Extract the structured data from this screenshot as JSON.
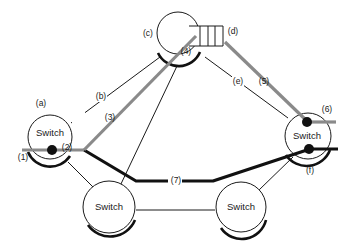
{
  "diagram": {
    "type": "network-path-diagram",
    "nodes": [
      {
        "id": "left-switch",
        "label": "Switch",
        "annotation": "(a)"
      },
      {
        "id": "top-node",
        "label": "",
        "annotation": "(c)",
        "port_annotation": "(4)"
      },
      {
        "id": "right-switch",
        "label": "Switch",
        "annotations": [
          "(6)",
          "(f)"
        ]
      },
      {
        "id": "bottom-left-switch",
        "label": "Switch"
      },
      {
        "id": "bottom-right-switch",
        "label": "Switch"
      }
    ],
    "queue": {
      "annotation": "(d)",
      "slots": 4
    },
    "links": [
      {
        "from": "left-switch",
        "to": "top-node",
        "annotation": "(b)",
        "style": "thin"
      },
      {
        "from": "top-node",
        "to": "right-switch",
        "annotation": "(e)",
        "style": "thin"
      },
      {
        "from": "left-switch",
        "to": "bottom-left-switch",
        "style": "thin"
      },
      {
        "from": "top-node",
        "to": "bottom-left-switch",
        "style": "thin"
      },
      {
        "from": "bottom-left-switch",
        "to": "bottom-right-switch",
        "style": "thin"
      },
      {
        "from": "bottom-right-switch",
        "to": "right-switch",
        "style": "thin"
      }
    ],
    "paths": {
      "gray": {
        "segments": [
          "(1)",
          "(2)",
          "(3)",
          "(4)",
          "(5)",
          "(6)"
        ],
        "color": "#8a8a8a"
      },
      "black": {
        "segments": [
          "(2)",
          "(7)",
          "(f)"
        ],
        "color": "#111111"
      }
    },
    "labels": {
      "a": "(a)",
      "b": "(b)",
      "c": "(c)",
      "d": "(d)",
      "e": "(e)",
      "f": "(f)",
      "p1": "(1)",
      "p2": "(2)",
      "p3": "(3)",
      "p4": "(4)",
      "p5": "(5)",
      "p6": "(6)",
      "p7": "(7)",
      "switch": "Switch"
    }
  }
}
